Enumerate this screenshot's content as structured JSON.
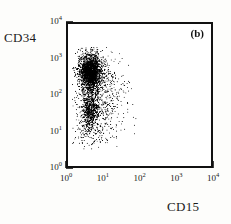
{
  "figure": {
    "panel_label": "(b)",
    "background_color": "#fdfdfb",
    "plot_background": "#ffffff",
    "frame_color": "#111111",
    "point_color": "#000000"
  },
  "chart_data": {
    "type": "scatter",
    "title": "",
    "subtitle": "",
    "panel": "(b)",
    "xlabel": "CD15",
    "ylabel": "CD34",
    "xscale": "log",
    "yscale": "log",
    "xlim": [
      1,
      10000
    ],
    "ylim": [
      1,
      10000
    ],
    "grid": false,
    "legend": null,
    "xticklabels": [
      "10",
      "10",
      "10",
      "10",
      "10"
    ],
    "xtick_exponents": [
      "0",
      "1",
      "2",
      "3",
      "4"
    ],
    "xtick_values": [
      1,
      10,
      100,
      1000,
      10000
    ],
    "yticklabels": [
      "10",
      "10",
      "10",
      "10",
      "10"
    ],
    "ytick_exponents": [
      "0",
      "1",
      "2",
      "3",
      "4"
    ],
    "ytick_values": [
      1,
      10,
      100,
      1000,
      10000
    ],
    "minor_ticks": true,
    "n_points": 1700,
    "cluster": {
      "x_log_mean": 0.66,
      "x_log_sd": 0.23,
      "y_log_mean": 2.35,
      "y_log_sd": 0.52,
      "x_log_min": 0.12,
      "x_log_max": 1.95,
      "y_log_min": 0.45,
      "y_log_max": 3.35
    },
    "series": [
      {
        "name": "events",
        "marker": "dot",
        "color": "#000000",
        "size": 1
      }
    ]
  },
  "axes": {
    "y_title": "CD34",
    "x_title": "CD15"
  }
}
